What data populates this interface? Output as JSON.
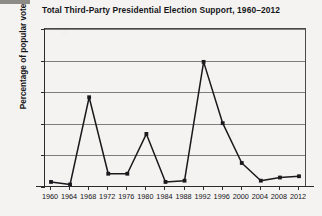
{
  "chart_data": {
    "type": "line",
    "title": "Total Third-Party Presidential Election Support, 1960–2012",
    "xlabel": "",
    "ylabel": "Percentage of popular vote",
    "categories": [
      1960,
      1964,
      1968,
      1972,
      1976,
      1980,
      1984,
      1988,
      1992,
      1996,
      2000,
      2004,
      2008,
      2012
    ],
    "values": [
      0.8,
      0.4,
      14.2,
      2.1,
      2.1,
      8.4,
      0.8,
      1.0,
      19.8,
      10.1,
      3.8,
      1.0,
      1.5,
      1.7
    ],
    "x_tick_labels": [
      "1960",
      "1964",
      "1968",
      "1972",
      "1976",
      "1980",
      "1984",
      "1988",
      "1992",
      "1996",
      "2000",
      "2004",
      "2008",
      "2012"
    ],
    "y_tick_labels": [
      "0",
      "5",
      "10",
      "15",
      "20",
      "25"
    ],
    "y_ticks": [
      0,
      5,
      10,
      15,
      20,
      25
    ],
    "ylim": [
      0,
      25
    ],
    "xlim": [
      1960,
      2012
    ],
    "grid": "horizontal",
    "legend": "none",
    "marker": "square",
    "line_color": "#1a1a1d",
    "grid_color": "#7d7d80",
    "background_color": "#f4f3f1"
  }
}
